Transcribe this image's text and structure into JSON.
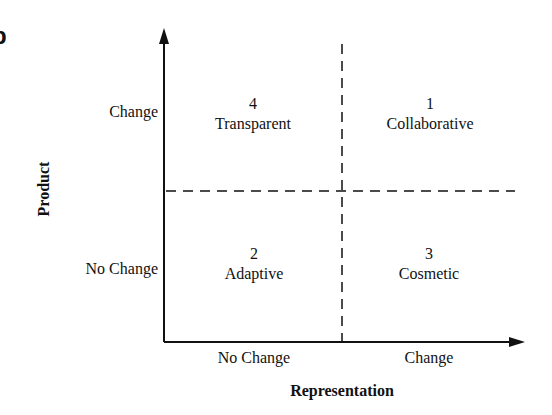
{
  "figure": {
    "panel_glyph": "b",
    "y_axis": {
      "title": "Product",
      "ticks": [
        "Change",
        "No Change"
      ]
    },
    "x_axis": {
      "title": "Representation",
      "ticks": [
        "No Change",
        "Change"
      ]
    },
    "quadrants": [
      {
        "position": "top-left",
        "number": "4",
        "label": "Transparent"
      },
      {
        "position": "top-right",
        "number": "1",
        "label": "Collaborative"
      },
      {
        "position": "bottom-left",
        "number": "2",
        "label": "Adaptive"
      },
      {
        "position": "bottom-right",
        "number": "3",
        "label": "Cosmetic"
      }
    ],
    "colors": {
      "line": "#111111",
      "background": "#ffffff"
    }
  }
}
